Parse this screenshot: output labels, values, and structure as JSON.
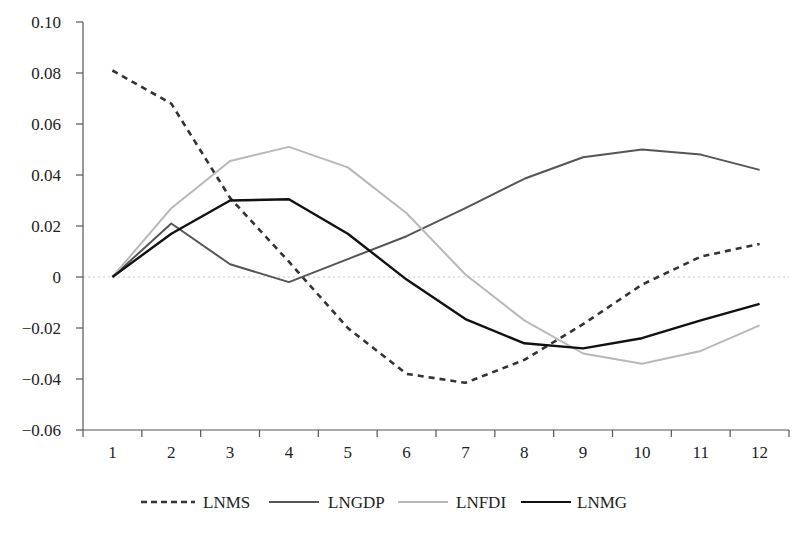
{
  "chart_data": {
    "type": "line",
    "title": "",
    "xlabel": "",
    "ylabel": "",
    "categories": [
      "1",
      "2",
      "3",
      "4",
      "5",
      "6",
      "7",
      "8",
      "9",
      "10",
      "11",
      "12"
    ],
    "ylim": [
      -0.06,
      0.1
    ],
    "yticks": [
      0.1,
      0.08,
      0.06,
      0.04,
      0.02,
      0,
      -0.02,
      -0.04,
      -0.06
    ],
    "ytick_labels": [
      "0.10",
      "0.08",
      "0.06",
      "0.04",
      "0.02",
      "0",
      "−0.02",
      "−0.04",
      "−0.06"
    ],
    "grid": false,
    "zero_line": "dotted",
    "legend_position": "bottom",
    "series": [
      {
        "name": "LNMS",
        "style": "dashed",
        "color": "#333333",
        "values": [
          0.081,
          0.068,
          0.031,
          0.006,
          -0.02,
          -0.038,
          -0.0415,
          -0.0325,
          -0.0185,
          -0.003,
          0.008,
          0.013
        ]
      },
      {
        "name": "LNGDP",
        "style": "solid",
        "color": "#555555",
        "values": [
          0,
          0.021,
          0.005,
          -0.002,
          0.007,
          0.016,
          0.027,
          0.0385,
          0.047,
          0.05,
          0.048,
          0.042
        ]
      },
      {
        "name": "LNFDI",
        "style": "solid",
        "color": "#b8b8b8",
        "values": [
          0,
          0.027,
          0.0455,
          0.051,
          0.043,
          0.025,
          0.001,
          -0.017,
          -0.03,
          -0.034,
          -0.029,
          -0.019
        ]
      },
      {
        "name": "LNMG",
        "style": "solid",
        "color": "#111111",
        "values": [
          0,
          0.017,
          0.03,
          0.0305,
          0.017,
          -0.001,
          -0.0165,
          -0.026,
          -0.028,
          -0.024,
          -0.017,
          -0.0105
        ]
      }
    ]
  }
}
